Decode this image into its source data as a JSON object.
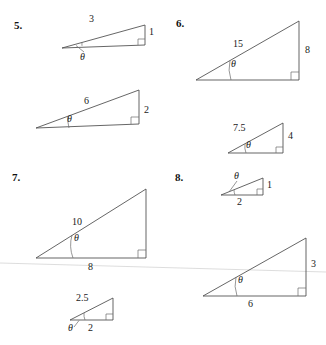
{
  "page": {
    "type": "trigonometry-worksheet",
    "theta_symbol": "θ",
    "ink_color": "#4a4a4a",
    "text_color": "#1a1a1a",
    "scan_artifact_color": "#d9d9d9"
  },
  "problems": [
    {
      "number": "5.",
      "triangles": [
        {
          "id": "p5-small",
          "hypotenuse_label": "3",
          "vertical_label": "1",
          "horizontal_label": "",
          "angle_label": "θ"
        },
        {
          "id": "p5-large",
          "hypotenuse_label": "6",
          "vertical_label": "2",
          "horizontal_label": "",
          "angle_label": "θ"
        }
      ]
    },
    {
      "number": "6.",
      "triangles": [
        {
          "id": "p6-large",
          "hypotenuse_label": "15",
          "vertical_label": "8",
          "horizontal_label": "",
          "angle_label": "θ"
        },
        {
          "id": "p6-small",
          "hypotenuse_label": "7.5",
          "vertical_label": "4",
          "horizontal_label": "",
          "angle_label": "θ"
        }
      ]
    },
    {
      "number": "7.",
      "triangles": [
        {
          "id": "p7-large",
          "hypotenuse_label": "10",
          "vertical_label": "",
          "horizontal_label": "8",
          "angle_label": "θ"
        },
        {
          "id": "p7-small",
          "hypotenuse_label": "2.5",
          "vertical_label": "",
          "horizontal_label": "2",
          "angle_label": "θ"
        }
      ]
    },
    {
      "number": "8.",
      "triangles": [
        {
          "id": "p8-small",
          "hypotenuse_label": "",
          "vertical_label": "1",
          "horizontal_label": "2",
          "angle_label": "θ"
        },
        {
          "id": "p8-large",
          "hypotenuse_label": "",
          "vertical_label": "3",
          "horizontal_label": "6",
          "angle_label": "θ"
        }
      ]
    }
  ]
}
